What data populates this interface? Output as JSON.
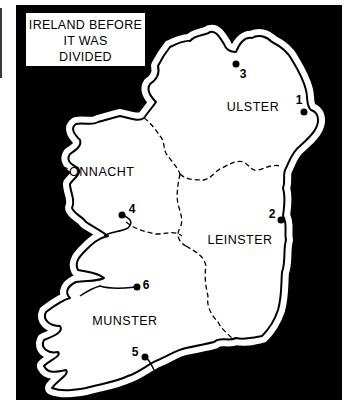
{
  "map": {
    "title_lines": [
      "IRELAND BEFORE",
      "IT WAS",
      "DIVIDED"
    ],
    "colors": {
      "sea": "#000000",
      "land": "#ffffff",
      "coast_halo": "#ffffff",
      "coastline": "#000000",
      "boundary": "#000000"
    },
    "provinces": [
      {
        "id": "ulster",
        "label": "ULSTER",
        "x": 253,
        "y": 107
      },
      {
        "id": "connacht",
        "label": "CONNACHT",
        "x": 97,
        "y": 172
      },
      {
        "id": "leinster",
        "label": "LEINSTER",
        "x": 240,
        "y": 240
      },
      {
        "id": "munster",
        "label": "MUNSTER",
        "x": 125,
        "y": 321
      }
    ],
    "markers": [
      {
        "number": "1",
        "dot_x": 304,
        "dot_y": 112,
        "label_x": 299,
        "label_y": 100
      },
      {
        "number": "2",
        "dot_x": 281,
        "dot_y": 220,
        "label_x": 272,
        "label_y": 214
      },
      {
        "number": "3",
        "dot_x": 236,
        "dot_y": 64,
        "label_x": 243,
        "label_y": 74
      },
      {
        "number": "4",
        "dot_x": 122,
        "dot_y": 215,
        "label_x": 132,
        "label_y": 209
      },
      {
        "number": "5",
        "dot_x": 145,
        "dot_y": 357,
        "label_x": 135,
        "label_y": 352
      },
      {
        "number": "6",
        "dot_x": 137,
        "dot_y": 287,
        "label_x": 146,
        "label_y": 285
      }
    ]
  }
}
